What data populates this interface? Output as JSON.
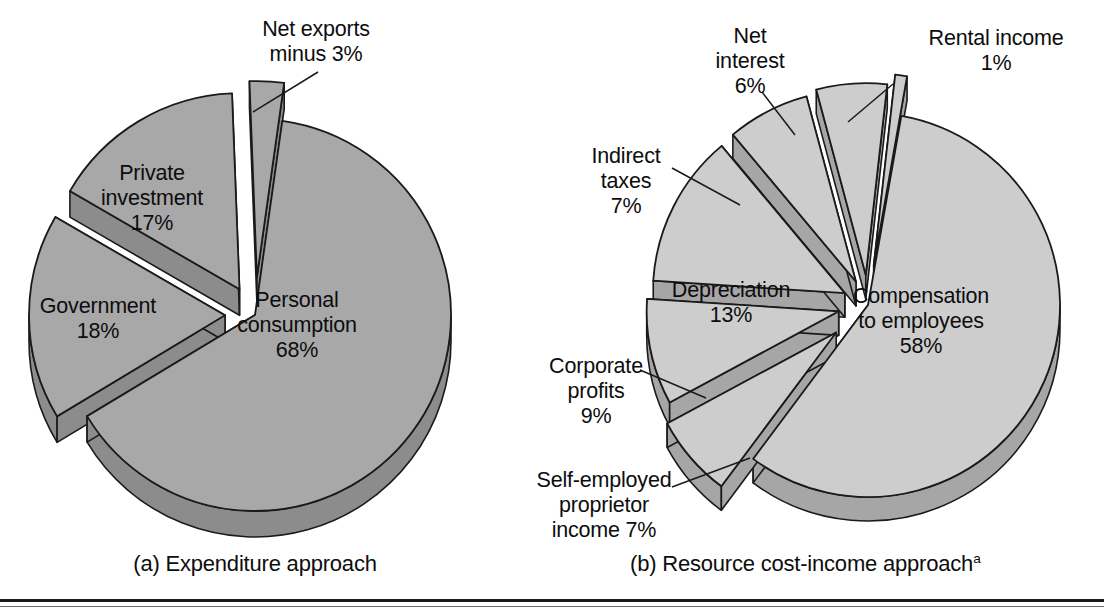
{
  "figure": {
    "background": "#ffffff",
    "rule_color": "#1a1a1a"
  },
  "chart_data": [
    {
      "type": "pie",
      "id": "expenditure-approach",
      "title": "(a) Expenditure approach",
      "caption": "(a) Expenditure approach",
      "caption_superscript": "",
      "fill_color": "#a8a8a8",
      "wall_color": "#8c8c8c",
      "edge_color": "#1a1a1a",
      "center": [
        255,
        315
      ],
      "radius": 196,
      "depth": 26,
      "start_angle": -82,
      "categories": [
        "Personal consumption",
        "Government",
        "Private investment",
        "Net exports minus"
      ],
      "values": [
        68,
        18,
        17,
        3
      ],
      "labels": [
        "Personal consumption\n68%",
        "Government\n18%",
        "Private investment\n17%",
        "Net exports\nminus 3%"
      ],
      "slices": [
        {
          "name": "Personal consumption",
          "value": 68,
          "percent_label": "68%",
          "label": "Personal\nconsumption\n68%",
          "explode": 0,
          "leader": false
        },
        {
          "name": "Government",
          "value": 18,
          "percent_label": "18%",
          "label": "Government\n18%",
          "explode": 30,
          "leader": false
        },
        {
          "name": "Private investment",
          "value": 17,
          "percent_label": "17%",
          "label": "Private\ninvestment\n17%",
          "explode": 30,
          "leader": false
        },
        {
          "name": "Net exports minus",
          "value": 3,
          "percent_label": "3%",
          "label": "Net exports\nminus 3%",
          "explode": 38,
          "leader": true
        }
      ],
      "ylabel": "",
      "xlabel": "",
      "legend": "none",
      "grid": false
    },
    {
      "type": "pie",
      "id": "resource-cost-income-approach",
      "title": "(b) Resource cost-income approach",
      "caption": "(b) Resource cost-income approach",
      "caption_superscript": "a",
      "fill_color": "#cdcdcd",
      "wall_color": "#a6a6a6",
      "edge_color": "#1a1a1a",
      "center": [
        868,
        305
      ],
      "radius": 192,
      "depth": 24,
      "start_angle": -80,
      "categories": [
        "Compensation to employees",
        "Depreciation",
        "Corporate profits",
        "Indirect taxes",
        "Self-employed proprietor income",
        "Net interest",
        "Rental income"
      ],
      "values": [
        58,
        13,
        9,
        7,
        7,
        6,
        1
      ],
      "labels": [
        "Compensation to employees 58%",
        "Depreciation 13%",
        "Corporate profits 9%",
        "Indirect taxes 7%",
        "Self-employed proprietor income 7%",
        "Net interest 6%",
        "Rental income 1%"
      ],
      "slices": [
        {
          "name": "Compensation to employees",
          "value": 58,
          "percent_label": "58%",
          "label": "Compensation\nto employees\n58%",
          "explode": 0,
          "leader": false
        },
        {
          "name": "Self-employed proprietor income",
          "value": 7,
          "percent_label": "7%",
          "label": "Self-employed\nproprietor\nincome 7%",
          "explode": 42,
          "leader": true
        },
        {
          "name": "Corporate profits",
          "value": 9,
          "percent_label": "9%",
          "label": "Corporate\nprofits\n9%",
          "explode": 30,
          "leader": true
        },
        {
          "name": "Depreciation",
          "value": 13,
          "percent_label": "13%",
          "label": "Depreciation\n13%",
          "explode": 26,
          "leader": false
        },
        {
          "name": "Indirect taxes",
          "value": 7,
          "percent_label": "7%",
          "label": "Indirect\ntaxes\n7%",
          "explode": 26,
          "leader": true
        },
        {
          "name": "Net interest",
          "value": 6,
          "percent_label": "6%",
          "label": "Net\ninterest\n6%",
          "explode": 30,
          "leader": true
        },
        {
          "name": "Rental income",
          "value": 1,
          "percent_label": "1%",
          "label": "Rental income\n1%",
          "explode": 40,
          "leader": true
        }
      ],
      "ylabel": "",
      "xlabel": "",
      "legend": "none",
      "grid": false
    }
  ],
  "labels_left": {
    "personal_consumption": "Personal\nconsumption\n68%",
    "government": "Government\n18%",
    "private_investment": "Private\ninvestment\n17%",
    "net_exports": "Net exports\nminus 3%"
  },
  "labels_right": {
    "compensation": "Compensation\nto employees\n58%",
    "depreciation": "Depreciation\n13%",
    "corporate_profits": "Corporate\nprofits\n9%",
    "indirect_taxes": "Indirect\ntaxes\n7%",
    "self_employed": "Self-employed\nproprietor\nincome 7%",
    "net_interest": "Net\ninterest\n6%",
    "rental_income": "Rental income\n1%"
  },
  "captions": {
    "left": "(a) Expenditure approach",
    "right": "(b) Resource cost-income approach",
    "right_superscript": "a"
  }
}
